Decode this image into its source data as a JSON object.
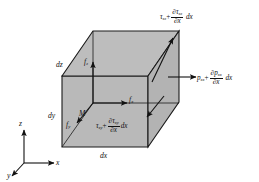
{
  "figure": {
    "kind": "fluid-element-stress-diagram",
    "colors": {
      "face_fill": "#b9b9b9",
      "face_fill_top": "#bcbcbc",
      "face_fill_side": "#b4b4b4",
      "stroke": "#1a1a1a",
      "background": "#ffffff"
    }
  },
  "labels": {
    "tau_xz": {
      "base": "τ",
      "base_sub": "xz",
      "plus": "+",
      "num": "∂τ",
      "num_sub": "xz",
      "den": "∂x",
      "tail": "dx"
    },
    "p_xx": {
      "base": "p",
      "base_sub": "xx",
      "plus": "+",
      "num": "∂p",
      "num_sub": "xx",
      "den": "∂x",
      "tail": "dx"
    },
    "tau_xy": {
      "base": "τ",
      "base_sub": "xy",
      "plus": "+",
      "num": "∂τ",
      "num_sub": "xy",
      "den": "∂x",
      "tail": "dx"
    }
  },
  "forces": {
    "fz": {
      "base": "f",
      "sub": "z"
    },
    "fx": {
      "base": "f",
      "sub": "x"
    },
    "fy": {
      "base": "f",
      "sub": "y"
    },
    "moment": {
      "base": "M"
    }
  },
  "dimensions": {
    "dz": "dz",
    "dy": "dy",
    "dx": "dx"
  },
  "axes": {
    "z": "z",
    "x": "x",
    "y": "y"
  }
}
